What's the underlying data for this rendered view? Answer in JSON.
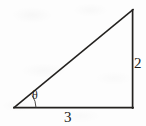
{
  "figure": {
    "kind": "right-triangle-diagram",
    "background_color": "#fdfdfd",
    "stroke_color": "#23211f",
    "labels": {
      "angle": "θ",
      "vertical_leg": "2",
      "base": "3"
    },
    "geometry": {
      "left_vertex": [
        14,
        108
      ],
      "right_vertex": [
        133,
        108
      ],
      "apex": [
        133,
        10
      ],
      "base_length_label": "3",
      "vertical_leg_label": "2",
      "angle_label": "θ",
      "angle_arc_radius": 22
    }
  }
}
